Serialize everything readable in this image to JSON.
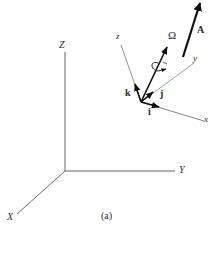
{
  "figure": {
    "caption": "(a)",
    "inertial_frame": {
      "axes": {
        "X": "X",
        "Y": "Y",
        "Z": "Z"
      }
    },
    "body_frame": {
      "axes": {
        "x": "x",
        "y": "y",
        "z": "z"
      },
      "unit_vectors": {
        "i": "i",
        "j": "j",
        "k": "k"
      }
    },
    "angular_velocity": {
      "label": "Ω"
    },
    "vector": {
      "label": "A"
    },
    "colors": {
      "line": "#555555",
      "bold_line": "#111111",
      "background": "#ffffff"
    }
  }
}
